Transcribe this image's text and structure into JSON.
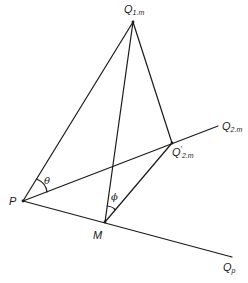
{
  "diagram": {
    "type": "geometry",
    "points": {
      "Q1m": {
        "label": "Q",
        "sub": "1.m",
        "x": 133,
        "y": 22
      },
      "P": {
        "label": "P",
        "x": 23,
        "y": 201
      },
      "M": {
        "label": "M",
        "x": 105,
        "y": 222
      },
      "Q2m_prime": {
        "label": "Q",
        "prime": "′",
        "sub": "2.m",
        "x": 172,
        "y": 143
      },
      "Q2m": {
        "label": "Q",
        "sub": "2.m",
        "x": 218,
        "y": 126
      },
      "Qp": {
        "label": "Q",
        "sub": "p",
        "x": 232,
        "y": 257
      }
    },
    "angles": {
      "theta": {
        "label": "θ"
      },
      "phi": {
        "label": "ϕ"
      }
    },
    "segments": [
      [
        "P",
        "Q1m"
      ],
      [
        "M",
        "Q1m"
      ],
      [
        "Q2m_prime",
        "Q1m"
      ],
      [
        "P",
        "Q2m"
      ],
      [
        "P",
        "Qp"
      ],
      [
        "M",
        "Q2m_prime"
      ]
    ],
    "line_color": "#1a1a1a"
  }
}
